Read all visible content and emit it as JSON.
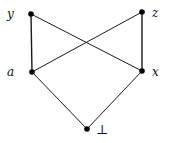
{
  "diagram": {
    "type": "hasse-diagram",
    "nodes": [
      {
        "id": "y",
        "label": "y"
      },
      {
        "id": "z",
        "label": "z"
      },
      {
        "id": "a",
        "label": "a"
      },
      {
        "id": "x",
        "label": "x"
      },
      {
        "id": "bottom",
        "label": "⊥"
      }
    ],
    "edges": [
      {
        "from": "y",
        "to": "a"
      },
      {
        "from": "y",
        "to": "x"
      },
      {
        "from": "z",
        "to": "a"
      },
      {
        "from": "z",
        "to": "x"
      },
      {
        "from": "a",
        "to": "bottom"
      },
      {
        "from": "x",
        "to": "bottom"
      }
    ]
  }
}
